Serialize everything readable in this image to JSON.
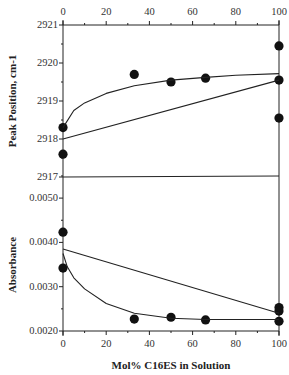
{
  "chart_data": [
    {
      "type": "scatter",
      "panel": "top",
      "title": "",
      "xlabel": "Mol% C16ES in Solution",
      "ylabel": "Peak Position, cm-1",
      "xlim": [
        0,
        100
      ],
      "ylim": [
        2917,
        2921
      ],
      "x_ticks": [
        "0",
        "20",
        "40",
        "60",
        "80",
        "100"
      ],
      "y_ticks": [
        "2917",
        "2918",
        "2919",
        "2920",
        "2921"
      ],
      "grid": false,
      "series": [
        {
          "name": "data",
          "kind": "points",
          "x": [
            0,
            0,
            33,
            50,
            66,
            100,
            100,
            100
          ],
          "y": [
            2918.3,
            2917.6,
            2919.7,
            2919.5,
            2919.6,
            2920.45,
            2919.55,
            2918.55
          ]
        },
        {
          "name": "ideal mixing (linear)",
          "kind": "line",
          "x": [
            0,
            100
          ],
          "y": [
            2918.0,
            2919.55
          ]
        },
        {
          "name": "fit curve",
          "kind": "curve",
          "x": [
            0,
            5,
            10,
            20,
            33,
            50,
            66,
            80,
            100
          ],
          "y": [
            2918.3,
            2918.75,
            2918.95,
            2919.2,
            2919.4,
            2919.55,
            2919.62,
            2919.68,
            2919.72
          ]
        }
      ]
    },
    {
      "type": "scatter",
      "panel": "bottom",
      "title": "",
      "xlabel": "Mol% C16ES in Solution",
      "ylabel": "Absorbance",
      "xlim": [
        0,
        100
      ],
      "ylim": [
        0.002,
        0.0055
      ],
      "x_ticks": [
        "0",
        "20",
        "40",
        "60",
        "80",
        "100"
      ],
      "y_ticks": [
        "0.0020",
        "0.0030",
        "0.0040",
        "0.0050"
      ],
      "grid": false,
      "series": [
        {
          "name": "data",
          "kind": "points",
          "x": [
            0,
            0,
            33,
            50,
            66,
            100,
            100,
            100
          ],
          "y": [
            0.00423,
            0.00342,
            0.00227,
            0.00231,
            0.00225,
            0.00253,
            0.00245,
            0.00222
          ]
        },
        {
          "name": "ideal mixing (linear)",
          "kind": "line",
          "x": [
            0,
            100
          ],
          "y": [
            0.00385,
            0.0024
          ]
        },
        {
          "name": "fit curve",
          "kind": "curve",
          "x": [
            0,
            2,
            5,
            10,
            20,
            33,
            50,
            66,
            80,
            100
          ],
          "y": [
            0.00375,
            0.00345,
            0.0032,
            0.00295,
            0.00262,
            0.0024,
            0.00229,
            0.00226,
            0.00226,
            0.00226
          ]
        }
      ]
    }
  ],
  "labels": {
    "ylabel_top": "Peak Position, cm-1",
    "ylabel_bottom": "Absorbance",
    "xlabel": "Mol% C16ES in Solution"
  },
  "colors": {
    "ink": "#222222",
    "background": "#ffffff"
  }
}
